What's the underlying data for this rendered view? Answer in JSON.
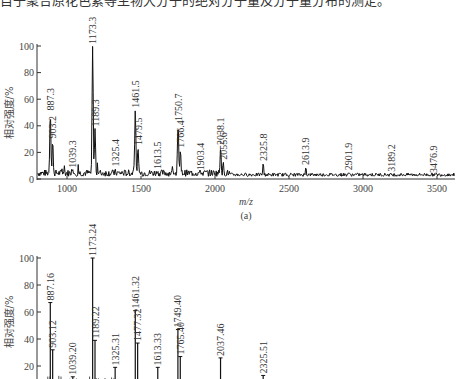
{
  "caption_text": "目于聚合原花色素等生物大分子的绝对分子量及分子量分布的测定。",
  "chart_data": [
    {
      "id": "a",
      "type": "line",
      "subtitle": "(a)",
      "xlabel": "m/z",
      "ylabel": "相对强度/%",
      "xlim": [
        800,
        3640
      ],
      "ylim": [
        0,
        100
      ],
      "xticks": [
        1000,
        1500,
        2000,
        2500,
        3000,
        3500
      ],
      "yticks": [
        0,
        20,
        40,
        60,
        80,
        100
      ],
      "grid": false,
      "peaks": [
        {
          "mz": 887.3,
          "label": "887.3",
          "intensity": 50
        },
        {
          "mz": 903.2,
          "label": "903.2",
          "intensity": 29
        },
        {
          "mz": 1039.3,
          "label": "1039.3",
          "intensity": 7
        },
        {
          "mz": 1173.3,
          "label": "1173.3",
          "intensity": 100
        },
        {
          "mz": 1189.3,
          "label": "1189.3",
          "intensity": 38
        },
        {
          "mz": 1325.4,
          "label": "1325.4",
          "intensity": 8
        },
        {
          "mz": 1461.5,
          "label": "1461.5",
          "intensity": 52
        },
        {
          "mz": 1479.5,
          "label": "1479.5",
          "intensity": 24
        },
        {
          "mz": 1613.5,
          "label": "1613.5",
          "intensity": 6
        },
        {
          "mz": 1750.7,
          "label": "1750.7",
          "intensity": 42
        },
        {
          "mz": 1766.4,
          "label": "1766.4",
          "intensity": 22
        },
        {
          "mz": 1903.4,
          "label": "1903.4",
          "intensity": 5
        },
        {
          "mz": 2038.1,
          "label": "2038.1",
          "intensity": 24
        },
        {
          "mz": 2055.6,
          "label": "2055.6",
          "intensity": 13
        },
        {
          "mz": 2325.8,
          "label": "2325.8",
          "intensity": 12
        },
        {
          "mz": 2613.9,
          "label": "2613.9",
          "intensity": 9
        },
        {
          "mz": 2901.9,
          "label": "2901.9",
          "intensity": 5
        },
        {
          "mz": 3189.2,
          "label": "3189.2",
          "intensity": 4
        },
        {
          "mz": 3476.9,
          "label": "3476.9",
          "intensity": 3
        }
      ]
    },
    {
      "id": "b",
      "type": "bar",
      "subtitle": "",
      "xlabel": "",
      "ylabel": "相对强度/%",
      "xlim": [
        800,
        3640
      ],
      "ylim": [
        0,
        100
      ],
      "yticks": [
        20,
        40,
        60,
        80,
        100
      ],
      "grid": false,
      "peaks": [
        {
          "mz": 887.16,
          "label": "887.16",
          "intensity": 67
        },
        {
          "mz": 903.12,
          "label": "903.12",
          "intensity": 32
        },
        {
          "mz": 1039.2,
          "label": "1039.20",
          "intensity": 12
        },
        {
          "mz": 1173.24,
          "label": "1173.24",
          "intensity": 100
        },
        {
          "mz": 1189.22,
          "label": "1189.22",
          "intensity": 39
        },
        {
          "mz": 1325.31,
          "label": "1325.31",
          "intensity": 19
        },
        {
          "mz": 1461.32,
          "label": "1461.32",
          "intensity": 61
        },
        {
          "mz": 1477.32,
          "label": "1477.32",
          "intensity": 37
        },
        {
          "mz": 1613.33,
          "label": "1613.33",
          "intensity": 19
        },
        {
          "mz": 1749.4,
          "label": "1749.40",
          "intensity": 47
        },
        {
          "mz": 1765.4,
          "label": "1765.40",
          "intensity": 27
        },
        {
          "mz": 2037.46,
          "label": "2037.46",
          "intensity": 26
        },
        {
          "mz": 2325.51,
          "label": "2325.51",
          "intensity": 13
        }
      ]
    }
  ]
}
